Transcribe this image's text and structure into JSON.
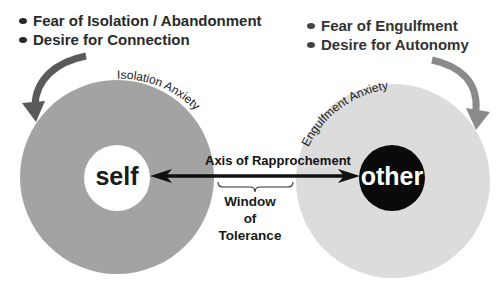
{
  "left_bullets": {
    "items": [
      "Fear of Isolation / Abandonment",
      "Desire for Connection"
    ]
  },
  "right_bullets": {
    "items": [
      "Fear of Engulfment",
      "Desire for Autonomy"
    ]
  },
  "left_circle": {
    "arc_label": "Isolation Anxiety",
    "center_label": "self",
    "outer_color": "#a3a3a3",
    "inner_color": "#ffffff"
  },
  "right_circle": {
    "arc_label": "Engulfment Anxiety",
    "center_label": "other",
    "outer_color": "#dcdcdc",
    "inner_color": "#0a0a0a"
  },
  "axis": {
    "label": "Axis of Rapprochement"
  },
  "window": {
    "line1": "Window",
    "line2": "of",
    "line3": "Tolerance"
  }
}
